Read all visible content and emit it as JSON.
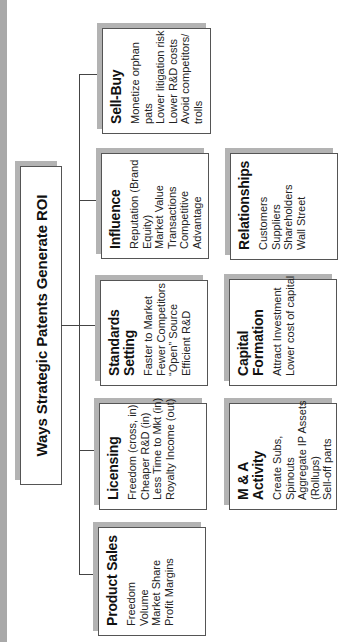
{
  "diagram": {
    "title": "Ways Strategic Patents Generate ROI",
    "columns": [
      {
        "name": "primary",
        "boxes": [
          {
            "heading": "Product Sales",
            "items": [
              "Freedom",
              "Volume",
              "Market Share",
              "Profit Margins"
            ]
          },
          {
            "heading": "Licensing",
            "items": [
              "Freedom (cross, in)",
              "Cheaper R&D (in)",
              "Less Time to Mkt (in)",
              "Royalty Income (out)"
            ]
          },
          {
            "heading": "Standards Setting",
            "heading_lines": [
              "Standards",
              "Setting"
            ],
            "items": [
              "Faster to Market",
              "Fewer Competitors",
              "“Open” Source",
              "Efficient R&D"
            ]
          },
          {
            "heading": "Influence",
            "items": [
              "Reputation (Brand",
              "Equity)",
              "Market Value",
              "Transactions",
              "Competitive",
              "Advantage"
            ]
          },
          {
            "heading": "Sell-Buy",
            "items": [
              "Monetize orphan",
              "pats",
              "Lower litigation risk",
              "Lower R&D costs",
              "Avoid competitors/",
              "trolls"
            ]
          }
        ]
      },
      {
        "name": "secondary",
        "boxes": [
          {
            "heading": "M & A Activity",
            "items": [
              "Create Subs,",
              "Spinouts",
              "Aggregate IP Assets",
              "(Rollups)",
              "Sell-off parts"
            ]
          },
          {
            "heading": "Capital Formation",
            "heading_lines": [
              "Capital",
              "Formation"
            ],
            "items": [
              "Attract Investment",
              "Lower cost of capital"
            ]
          },
          {
            "heading": "Relationships",
            "items": [
              "Customers",
              "Suppliers",
              "Shareholders",
              "Wall Street"
            ]
          }
        ]
      }
    ],
    "colors": {
      "border": "#555555",
      "shadow": "#b3b3b3",
      "strip": "#a9a9a9",
      "connector": "#444444"
    },
    "orientation": "rotated -90deg"
  }
}
